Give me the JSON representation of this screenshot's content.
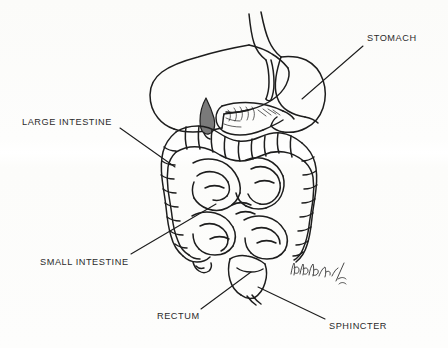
{
  "image": {
    "kind": "hand-drawn anatomical illustration",
    "subject": "human digestive system",
    "background_color": "#fdfdfc",
    "ink_color": "#1d1d1d",
    "width": 448,
    "height": 348
  },
  "labels": [
    {
      "id": "stomach",
      "text": "STOMACH",
      "x": 367,
      "y": 33,
      "leader": {
        "x1": 363,
        "y1": 46,
        "x2": 302,
        "y2": 99
      }
    },
    {
      "id": "large-intestine",
      "text": "LARGE INTESTINE",
      "x": 22,
      "y": 117,
      "leader": {
        "x1": 120,
        "y1": 128,
        "x2": 175,
        "y2": 167
      }
    },
    {
      "id": "small-intestine",
      "text": "SMALL INTESTINE",
      "x": 40,
      "y": 257,
      "leader": {
        "x1": 131,
        "y1": 254,
        "x2": 216,
        "y2": 204
      }
    },
    {
      "id": "rectum",
      "text": "RECTUM",
      "x": 157,
      "y": 311,
      "leader": {
        "x1": 201,
        "y1": 309,
        "x2": 251,
        "y2": 272
      }
    },
    {
      "id": "sphincter",
      "text": "SPHINCTER",
      "x": 329,
      "y": 321,
      "leader": {
        "x1": 325,
        "y1": 319,
        "x2": 258,
        "y2": 287
      }
    }
  ],
  "organs": [
    {
      "id": "esophagus",
      "name": "esophagus"
    },
    {
      "id": "liver",
      "name": "liver"
    },
    {
      "id": "stomach",
      "name": "stomach"
    },
    {
      "id": "gallbladder",
      "name": "gallbladder"
    },
    {
      "id": "pancreas",
      "name": "pancreas"
    },
    {
      "id": "duodenum",
      "name": "duodenum"
    },
    {
      "id": "transverse-colon",
      "name": "transverse colon"
    },
    {
      "id": "ascending-colon",
      "name": "ascending colon"
    },
    {
      "id": "descending-colon",
      "name": "descending colon"
    },
    {
      "id": "small-intestine",
      "name": "small intestine coils"
    },
    {
      "id": "cecum-appendix",
      "name": "cecum and appendix"
    },
    {
      "id": "rectum",
      "name": "rectum"
    },
    {
      "id": "sphincter",
      "name": "anal sphincter"
    }
  ],
  "signature": {
    "present": true,
    "description": "handwritten artist signature with year mark",
    "x": 289,
    "y": 258
  }
}
